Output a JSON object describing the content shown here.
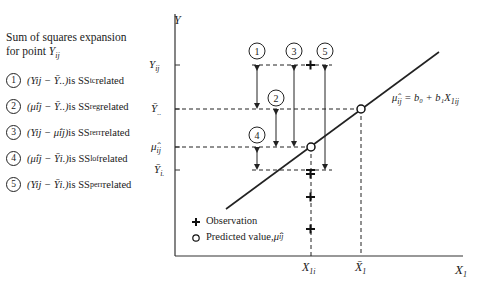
{
  "caption": {
    "line1": "Sum of squares expansion",
    "line2": "for point ",
    "point": "Y",
    "point_sub": "ij"
  },
  "legend": [
    {
      "num": "1",
      "expr": "(Yij − Ȳ..)",
      "text": " is SS",
      "sub": "tc",
      "suffix": " related"
    },
    {
      "num": "2",
      "expr": "(μ̂ij − Ȳ..)",
      "text": " is SS",
      "sub": "reg",
      "suffix": " related"
    },
    {
      "num": "3",
      "expr": "(Yij − μ̂ij)",
      "text": " is SS",
      "sub": "rerr",
      "suffix": " related"
    },
    {
      "num": "4",
      "expr": "(μ̂ij − Ȳi.)",
      "text": " is SS",
      "sub": "lof",
      "suffix": " related"
    },
    {
      "num": "5",
      "expr": "(Yij − Ȳi.)",
      "text": " is SS",
      "sub": "perr",
      "suffix": " related"
    }
  ],
  "axes": {
    "y_label": "Y",
    "x_label": "X",
    "x_label_sub": "1",
    "y_ticks": [
      {
        "label": "Y",
        "sub": "ij"
      },
      {
        "label": "Ȳ",
        "sub": ".."
      },
      {
        "label": "μ̂",
        "sub": "ij"
      },
      {
        "label": "Ȳ",
        "sub": "i."
      }
    ],
    "x_ticks": [
      {
        "label": "X",
        "sub": "1i"
      },
      {
        "label": "X̄",
        "sub": "1"
      }
    ]
  },
  "regression_label": {
    "lhs": "μ̂",
    "lhs_sub": "ij",
    "rhs": " = b₀ + b₁X",
    "rhs_sub": "1ij"
  },
  "markers": [
    "1",
    "2",
    "3",
    "4",
    "5"
  ],
  "key": {
    "observation": "Observation",
    "predicted": "Predicted value, ",
    "predicted_sym": "μ̂",
    "predicted_sub": "ij"
  }
}
